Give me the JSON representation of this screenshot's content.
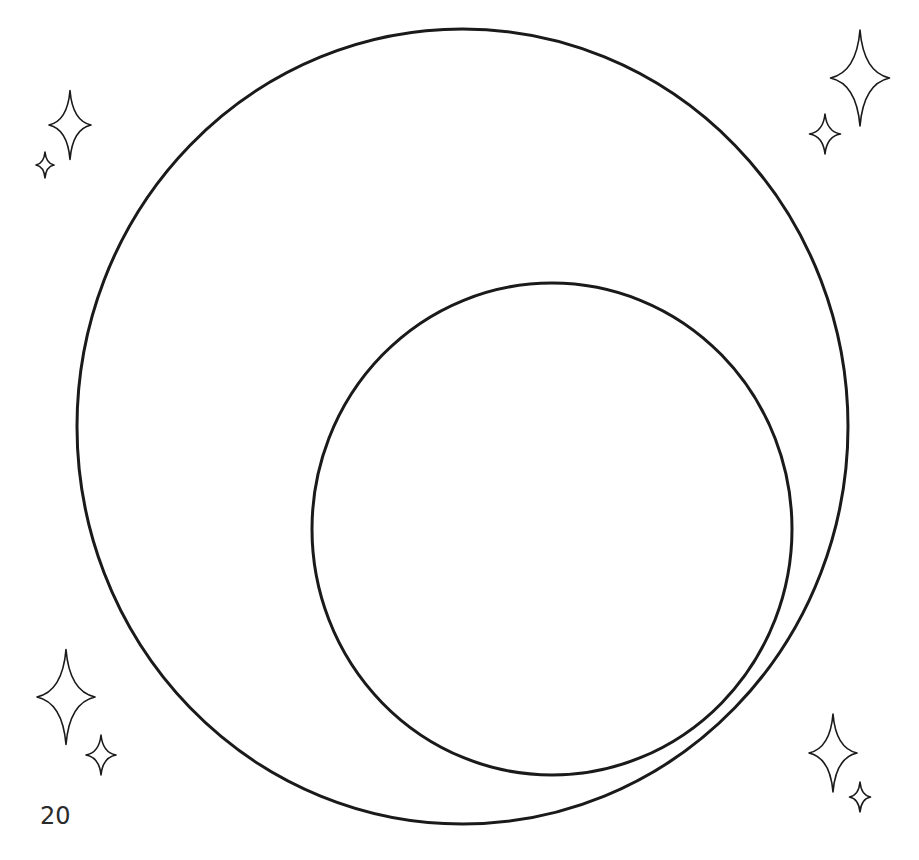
{
  "page": {
    "page_number": "20",
    "background_color": "#ffffff",
    "stroke_color": "#1a1a1a"
  },
  "shapes": {
    "outer_circle": {
      "cx": 462.5,
      "cy": 426.5,
      "rx": 385.5,
      "ry": 397.5,
      "stroke_width": 3
    },
    "inner_circle": {
      "cx": 552,
      "cy": 529,
      "rx": 240,
      "ry": 246,
      "stroke_width": 3
    }
  },
  "decorations": {
    "sparkles": [
      {
        "name": "sparkle-top-left-large",
        "cx": 70,
        "cy": 125,
        "w": 42,
        "h": 69
      },
      {
        "name": "sparkle-top-left-small",
        "cx": 45,
        "cy": 165,
        "w": 18,
        "h": 26
      },
      {
        "name": "sparkle-top-right-large",
        "cx": 860,
        "cy": 78,
        "w": 59,
        "h": 96
      },
      {
        "name": "sparkle-top-right-small",
        "cx": 825,
        "cy": 134,
        "w": 31,
        "h": 40
      },
      {
        "name": "sparkle-bottom-left-large",
        "cx": 66,
        "cy": 697,
        "w": 58,
        "h": 95
      },
      {
        "name": "sparkle-bottom-left-small",
        "cx": 101,
        "cy": 755,
        "w": 30,
        "h": 40
      },
      {
        "name": "sparkle-bottom-right-large",
        "cx": 833,
        "cy": 753,
        "w": 48,
        "h": 78
      },
      {
        "name": "sparkle-bottom-right-small",
        "cx": 860,
        "cy": 797,
        "w": 21,
        "h": 30
      }
    ]
  }
}
